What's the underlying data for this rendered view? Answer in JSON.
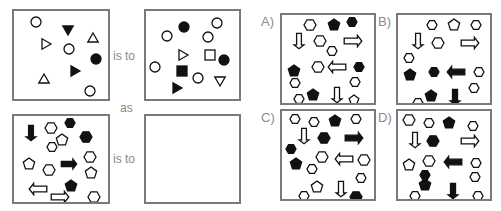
{
  "puzzle": {
    "connector_is_to": "is to",
    "connector_as": "as",
    "stroke_color": "#111111",
    "fill_black": "#111111",
    "fill_white": "#ffffff",
    "border_color": "#7a7a7a",
    "label_color": "#8a8a8a"
  },
  "panels": {
    "p1": {
      "shapes": [
        {
          "t": "circle",
          "x": 22,
          "y": 11,
          "s": 5,
          "f": "w"
        },
        {
          "t": "tri-down",
          "x": 54,
          "y": 18,
          "s": 6,
          "f": "b"
        },
        {
          "t": "tri-right",
          "x": 31,
          "y": 33,
          "s": 6,
          "f": "w"
        },
        {
          "t": "tri-up",
          "x": 79,
          "y": 28,
          "s": 6,
          "f": "w"
        },
        {
          "t": "circle",
          "x": 55,
          "y": 38,
          "s": 5,
          "f": "w"
        },
        {
          "t": "circle",
          "x": 82,
          "y": 48,
          "s": 5,
          "f": "b"
        },
        {
          "t": "tri-right",
          "x": 60,
          "y": 60,
          "s": 6,
          "f": "b"
        },
        {
          "t": "tri-up",
          "x": 30,
          "y": 69,
          "s": 6,
          "f": "w"
        },
        {
          "t": "circle",
          "x": 76,
          "y": 80,
          "s": 5,
          "f": "w"
        }
      ]
    },
    "p2": {
      "shapes": [
        {
          "t": "circle",
          "x": 38,
          "y": 16,
          "s": 5,
          "f": "b"
        },
        {
          "t": "circle",
          "x": 71,
          "y": 12,
          "s": 5,
          "f": "w"
        },
        {
          "t": "circle",
          "x": 21,
          "y": 25,
          "s": 5,
          "f": "w"
        },
        {
          "t": "circle",
          "x": 62,
          "y": 26,
          "s": 5,
          "f": "w"
        },
        {
          "t": "tri-right",
          "x": 36,
          "y": 44,
          "s": 6,
          "f": "w"
        },
        {
          "t": "square",
          "x": 64,
          "y": 44,
          "s": 5,
          "f": "w"
        },
        {
          "t": "circle",
          "x": 78,
          "y": 49,
          "s": 5,
          "f": "b"
        },
        {
          "t": "circle",
          "x": 9,
          "y": 56,
          "s": 5,
          "f": "w"
        },
        {
          "t": "square",
          "x": 36,
          "y": 60,
          "s": 5,
          "f": "b"
        },
        {
          "t": "circle",
          "x": 52,
          "y": 67,
          "s": 5,
          "f": "w"
        },
        {
          "t": "tri-down",
          "x": 74,
          "y": 69,
          "s": 6,
          "f": "w"
        },
        {
          "t": "tri-right",
          "x": 30,
          "y": 77,
          "s": 6,
          "f": "b"
        }
      ]
    },
    "p3": {
      "shapes": [
        {
          "t": "arrow-down",
          "x": 17,
          "y": 17,
          "s": 7,
          "f": "b"
        },
        {
          "t": "hex",
          "x": 37,
          "y": 12,
          "s": 6,
          "f": "w"
        },
        {
          "t": "hex",
          "x": 56,
          "y": 7,
          "s": 5,
          "f": "b"
        },
        {
          "t": "pent",
          "x": 48,
          "y": 24,
          "s": 6,
          "f": "w"
        },
        {
          "t": "hex",
          "x": 38,
          "y": 31,
          "s": 5,
          "f": "w"
        },
        {
          "t": "hex",
          "x": 72,
          "y": 21,
          "s": 6,
          "f": "b"
        },
        {
          "t": "hex",
          "x": 76,
          "y": 41,
          "s": 6,
          "f": "w"
        },
        {
          "t": "pent",
          "x": 15,
          "y": 48,
          "s": 6,
          "f": "w"
        },
        {
          "t": "hex",
          "x": 35,
          "y": 54,
          "s": 6,
          "f": "w"
        },
        {
          "t": "arrow-right",
          "x": 55,
          "y": 48,
          "s": 7,
          "f": "b"
        },
        {
          "t": "pent",
          "x": 77,
          "y": 57,
          "s": 6,
          "f": "w"
        },
        {
          "t": "pent",
          "x": 57,
          "y": 70,
          "s": 6,
          "f": "b"
        },
        {
          "t": "arrow-left",
          "x": 24,
          "y": 73,
          "s": 8,
          "f": "w"
        },
        {
          "t": "arrow-right",
          "x": 46,
          "y": 81,
          "s": 8,
          "f": "w"
        },
        {
          "t": "hex",
          "x": 80,
          "y": 81,
          "s": 6,
          "f": "w"
        }
      ]
    },
    "p4": {
      "shapes": []
    }
  },
  "options": [
    {
      "label": "A)",
      "shapes": [
        {
          "t": "hex",
          "x": 28,
          "y": 10,
          "s": 6,
          "f": "w"
        },
        {
          "t": "pent",
          "x": 52,
          "y": 10,
          "s": 6,
          "f": "b"
        },
        {
          "t": "hex",
          "x": 70,
          "y": 7,
          "s": 5,
          "f": "b"
        },
        {
          "t": "arrow-down",
          "x": 17,
          "y": 26,
          "s": 7,
          "f": "w"
        },
        {
          "t": "hex",
          "x": 38,
          "y": 26,
          "s": 6,
          "f": "w"
        },
        {
          "t": "arrow-right",
          "x": 71,
          "y": 26,
          "s": 8,
          "f": "w"
        },
        {
          "t": "hex",
          "x": 50,
          "y": 36,
          "s": 5,
          "f": "w"
        },
        {
          "t": "hex",
          "x": 36,
          "y": 52,
          "s": 6,
          "f": "w"
        },
        {
          "t": "arrow-left",
          "x": 55,
          "y": 52,
          "s": 8,
          "f": "w"
        },
        {
          "t": "hex",
          "x": 77,
          "y": 52,
          "s": 5,
          "f": "b"
        },
        {
          "t": "pent",
          "x": 12,
          "y": 56,
          "s": 6,
          "f": "b"
        },
        {
          "t": "hex",
          "x": 13,
          "y": 68,
          "s": 5,
          "f": "w"
        },
        {
          "t": "hex",
          "x": 73,
          "y": 67,
          "s": 5,
          "f": "w"
        },
        {
          "t": "pent",
          "x": 31,
          "y": 80,
          "s": 6,
          "f": "b"
        },
        {
          "t": "hex",
          "x": 17,
          "y": 84,
          "s": 5,
          "f": "w"
        },
        {
          "t": "arrow-down",
          "x": 55,
          "y": 80,
          "s": 7,
          "f": "w"
        },
        {
          "t": "pent",
          "x": 72,
          "y": 85,
          "s": 5,
          "f": "w"
        }
      ]
    },
    {
      "label": "B)",
      "shapes": [
        {
          "t": "hex",
          "x": 34,
          "y": 10,
          "s": 5,
          "f": "w"
        },
        {
          "t": "pent",
          "x": 56,
          "y": 10,
          "s": 6,
          "f": "w"
        },
        {
          "t": "hex",
          "x": 78,
          "y": 10,
          "s": 5,
          "f": "w"
        },
        {
          "t": "arrow-down",
          "x": 20,
          "y": 26,
          "s": 7,
          "f": "w"
        },
        {
          "t": "hex",
          "x": 40,
          "y": 28,
          "s": 6,
          "f": "w"
        },
        {
          "t": "arrow-right",
          "x": 72,
          "y": 28,
          "s": 8,
          "f": "w"
        },
        {
          "t": "hex",
          "x": 11,
          "y": 43,
          "s": 5,
          "f": "w"
        },
        {
          "t": "pent",
          "x": 12,
          "y": 60,
          "s": 6,
          "f": "b"
        },
        {
          "t": "hex",
          "x": 36,
          "y": 57,
          "s": 5,
          "f": "b"
        },
        {
          "t": "arrow-left",
          "x": 58,
          "y": 57,
          "s": 8,
          "f": "b"
        },
        {
          "t": "hex",
          "x": 81,
          "y": 57,
          "s": 5,
          "f": "w"
        },
        {
          "t": "hex",
          "x": 76,
          "y": 73,
          "s": 5,
          "f": "w"
        },
        {
          "t": "pent",
          "x": 33,
          "y": 81,
          "s": 6,
          "f": "b"
        },
        {
          "t": "hex",
          "x": 20,
          "y": 88,
          "s": 5,
          "f": "w"
        },
        {
          "t": "arrow-down",
          "x": 57,
          "y": 82,
          "s": 7,
          "f": "b"
        }
      ]
    },
    {
      "label": "C)",
      "shapes": [
        {
          "t": "hex",
          "x": 13,
          "y": 8,
          "s": 5,
          "f": "w"
        },
        {
          "t": "hex",
          "x": 32,
          "y": 11,
          "s": 5,
          "f": "w"
        },
        {
          "t": "pent",
          "x": 53,
          "y": 10,
          "s": 6,
          "f": "b"
        },
        {
          "t": "hex",
          "x": 74,
          "y": 8,
          "s": 5,
          "f": "w"
        },
        {
          "t": "arrow-down",
          "x": 22,
          "y": 25,
          "s": 7,
          "f": "w"
        },
        {
          "t": "hex",
          "x": 42,
          "y": 27,
          "s": 6,
          "f": "b"
        },
        {
          "t": "arrow-right",
          "x": 72,
          "y": 27,
          "s": 8,
          "f": "b"
        },
        {
          "t": "hex",
          "x": 9,
          "y": 38,
          "s": 5,
          "f": "b"
        },
        {
          "t": "hex",
          "x": 40,
          "y": 46,
          "s": 6,
          "f": "w"
        },
        {
          "t": "arrow-left",
          "x": 62,
          "y": 48,
          "s": 8,
          "f": "w"
        },
        {
          "t": "hex",
          "x": 82,
          "y": 49,
          "s": 6,
          "f": "w"
        },
        {
          "t": "pent",
          "x": 14,
          "y": 53,
          "s": 6,
          "f": "b"
        },
        {
          "t": "hex",
          "x": 30,
          "y": 58,
          "s": 5,
          "f": "w"
        },
        {
          "t": "hex",
          "x": 79,
          "y": 67,
          "s": 5,
          "f": "w"
        },
        {
          "t": "pent",
          "x": 35,
          "y": 76,
          "s": 6,
          "f": "w"
        },
        {
          "t": "hex",
          "x": 22,
          "y": 85,
          "s": 5,
          "f": "w"
        },
        {
          "t": "arrow-down",
          "x": 59,
          "y": 78,
          "s": 7,
          "f": "w"
        },
        {
          "t": "hex",
          "x": 74,
          "y": 86,
          "s": 6,
          "f": "b"
        }
      ]
    },
    {
      "label": "D)",
      "shapes": [
        {
          "t": "hex",
          "x": 11,
          "y": 9,
          "s": 6,
          "f": "w"
        },
        {
          "t": "hex",
          "x": 31,
          "y": 12,
          "s": 5,
          "f": "w"
        },
        {
          "t": "pent",
          "x": 51,
          "y": 12,
          "s": 6,
          "f": "b"
        },
        {
          "t": "hex",
          "x": 75,
          "y": 15,
          "s": 5,
          "f": "w"
        },
        {
          "t": "arrow-down",
          "x": 17,
          "y": 29,
          "s": 7,
          "f": "w"
        },
        {
          "t": "hex",
          "x": 35,
          "y": 30,
          "s": 6,
          "f": "b"
        },
        {
          "t": "arrow-right",
          "x": 72,
          "y": 30,
          "s": 8,
          "f": "w"
        },
        {
          "t": "pent",
          "x": 11,
          "y": 54,
          "s": 6,
          "f": "w"
        },
        {
          "t": "hex",
          "x": 31,
          "y": 50,
          "s": 6,
          "f": "w"
        },
        {
          "t": "arrow-left",
          "x": 55,
          "y": 51,
          "s": 8,
          "f": "b"
        },
        {
          "t": "hex",
          "x": 78,
          "y": 52,
          "s": 5,
          "f": "w"
        },
        {
          "t": "hex",
          "x": 27,
          "y": 64,
          "s": 5,
          "f": "b"
        },
        {
          "t": "hex",
          "x": 77,
          "y": 66,
          "s": 5,
          "f": "w"
        },
        {
          "t": "pent",
          "x": 27,
          "y": 74,
          "s": 6,
          "f": "b"
        },
        {
          "t": "hex",
          "x": 17,
          "y": 85,
          "s": 5,
          "f": "w"
        },
        {
          "t": "arrow-down",
          "x": 55,
          "y": 80,
          "s": 7,
          "f": "b"
        },
        {
          "t": "hex",
          "x": 80,
          "y": 85,
          "s": 5,
          "f": "w"
        }
      ]
    }
  ]
}
